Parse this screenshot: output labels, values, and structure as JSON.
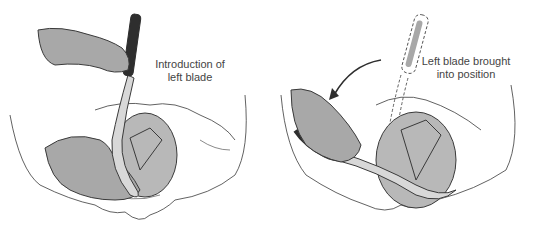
{
  "figure": {
    "panels": [
      {
        "id": "left",
        "caption_line1": "Introduction of",
        "caption_line2": "left blade"
      },
      {
        "id": "right",
        "caption_line1": "Left blade brought",
        "caption_line2": "into position"
      }
    ],
    "colors": {
      "background": "#ffffff",
      "outline": "#3a3a3a",
      "glove": "#a8a8a8",
      "head": "#b8b8b8",
      "blade_dark": "#2e2e2e",
      "bone": "#ffffff"
    }
  }
}
